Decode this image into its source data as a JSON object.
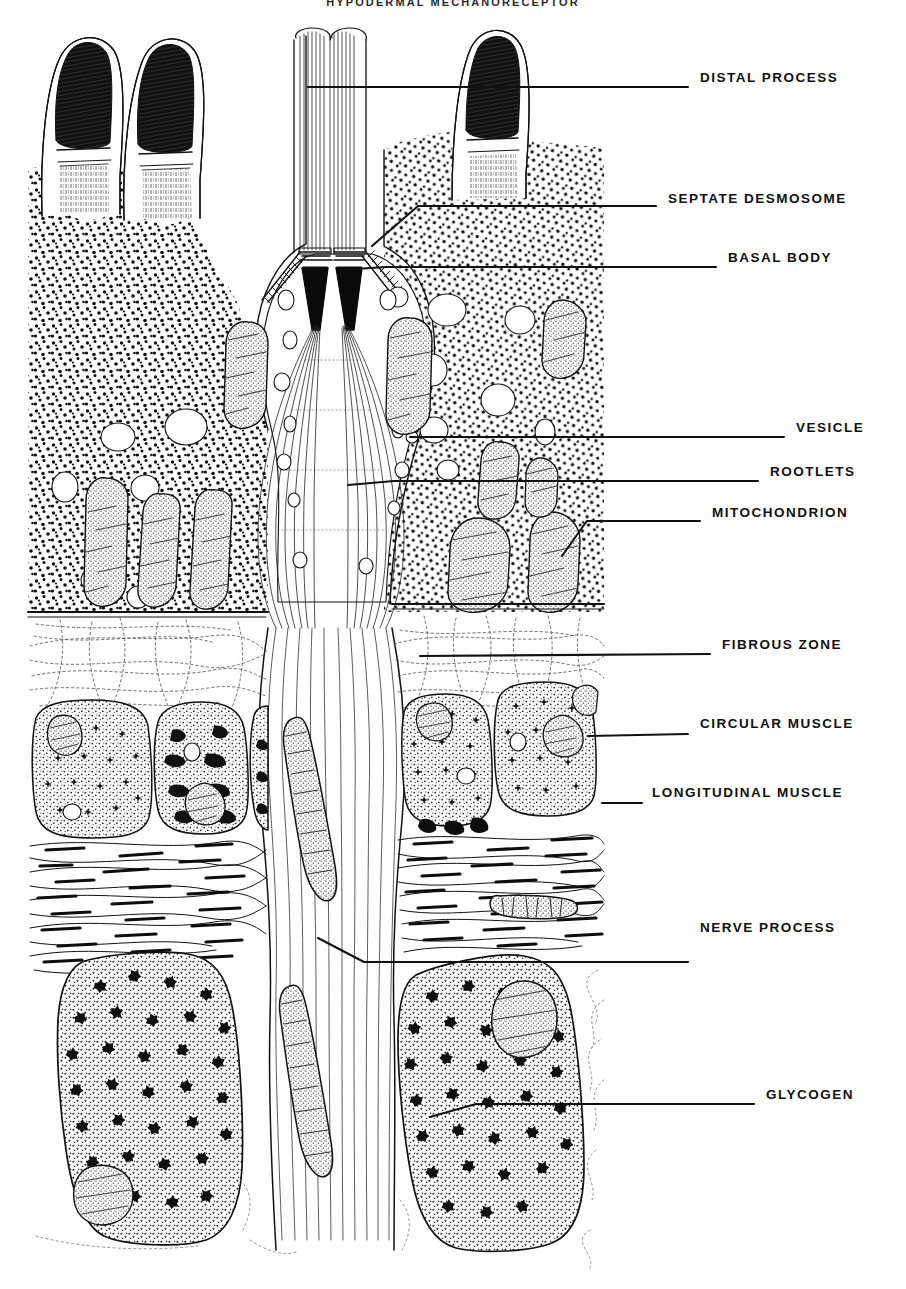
{
  "figure": {
    "title": "HYPODERMAL MECHANORECEPTOR",
    "type": "scientific-line-illustration",
    "render": "black ink stipple drawing on white background",
    "ink_color": "#111111",
    "background_color": "#ffffff"
  },
  "labels": [
    {
      "id": "distal-process",
      "text": "DISTAL  PROCESS",
      "x": 700,
      "y": 78,
      "leader_x1": 308,
      "leader_y1": 87,
      "leader_x2": 688,
      "leader_y2": 87
    },
    {
      "id": "septate-desmosome",
      "text": "SEPTATE  DESMOSOME",
      "x": 668,
      "y": 199,
      "leader_x1": 372,
      "leader_y1": 246,
      "leader_x2": 656,
      "leader_y2": 206
    },
    {
      "id": "basal-body",
      "text": "BASAL  BODY",
      "x": 728,
      "y": 258,
      "leader_x1": 340,
      "leader_y1": 270,
      "leader_x2": 716,
      "leader_y2": 267
    },
    {
      "id": "vesicle",
      "text": "VESICLE",
      "x": 796,
      "y": 428,
      "leader_x1": 410,
      "leader_y1": 437,
      "leader_x2": 784,
      "leader_y2": 437
    },
    {
      "id": "rootlets",
      "text": "ROOTLETS",
      "x": 770,
      "y": 472,
      "leader_x1": 348,
      "leader_y1": 485,
      "leader_x2": 758,
      "leader_y2": 481
    },
    {
      "id": "mitochondrion",
      "text": "MITOCHONDRION",
      "x": 712,
      "y": 513,
      "leader_x1": 562,
      "leader_y1": 556,
      "leader_x2": 700,
      "leader_y2": 521
    },
    {
      "id": "fibrous-zone",
      "text": "FIBROUS  ZONE",
      "x": 722,
      "y": 645,
      "leader_x1": 420,
      "leader_y1": 656,
      "leader_x2": 710,
      "leader_y2": 654
    },
    {
      "id": "circular-muscle",
      "text": "CIRCULAR  MUSCLE",
      "x": 700,
      "y": 724,
      "leader_x1": 588,
      "leader_y1": 736,
      "leader_x2": 688,
      "leader_y2": 734
    },
    {
      "id": "longitudinal-muscle",
      "text": "LONGITUDINAL  MUSCLE",
      "x": 652,
      "y": 793,
      "leader_x1": 602,
      "leader_y1": 803,
      "leader_x2": 642,
      "leader_y2": 803
    },
    {
      "id": "nerve-process",
      "text": "NERVE  PROCESS",
      "x": 700,
      "y": 928,
      "leader_x1": 318,
      "leader_y1": 938,
      "leader_x2": 688,
      "leader_y2": 962
    },
    {
      "id": "glycogen",
      "text": "GLYCOGEN",
      "x": 766,
      "y": 1095,
      "leader_x1": 430,
      "leader_y1": 1117,
      "leader_x2": 754,
      "leader_y2": 1104
    }
  ],
  "regions": [
    {
      "id": "distal-processes",
      "label": "distal processes with dark electron-dense tips",
      "count": 5
    },
    {
      "id": "epithelial-cytoplasm",
      "label": "stippled epithelial cytoplasm"
    },
    {
      "id": "sensory-cell",
      "label": "central sensory cell with paired basal bodies and striated rootlets"
    },
    {
      "id": "fibrous-zone",
      "label": "fibrous zone of fine collagen fibrils"
    },
    {
      "id": "circular-muscle",
      "label": "circular muscle cells in cross section",
      "count": 5
    },
    {
      "id": "longitudinal-muscle",
      "label": "longitudinal muscle in longitudinal section"
    },
    {
      "id": "glycogen-cells",
      "label": "glycogen-laden cells with rosette granules",
      "count": 2
    },
    {
      "id": "nerve-process",
      "label": "descending nerve process bundle with elongate mitochondria"
    }
  ]
}
